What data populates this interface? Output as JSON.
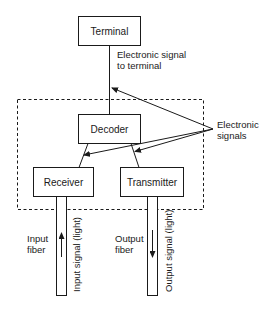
{
  "diagram": {
    "boxes": {
      "terminal": "Terminal",
      "decoder": "Decoder",
      "receiver": "Receiver",
      "transmitter": "Transmitter"
    },
    "labels": {
      "signal_to_terminal_line1": "Electronic signal",
      "signal_to_terminal_line2": "to terminal",
      "electronic_signals_line1": "Electronic",
      "electronic_signals_line2": "signals",
      "input_fiber_line1": "Input",
      "input_fiber_line2": "fiber",
      "output_fiber_line1": "Output",
      "output_fiber_line2": "fiber",
      "input_signal": "Input signal (light)",
      "output_signal": "Output signal (light)"
    },
    "colors": {
      "stroke": "#1a1a1a",
      "background": "#ffffff"
    }
  }
}
